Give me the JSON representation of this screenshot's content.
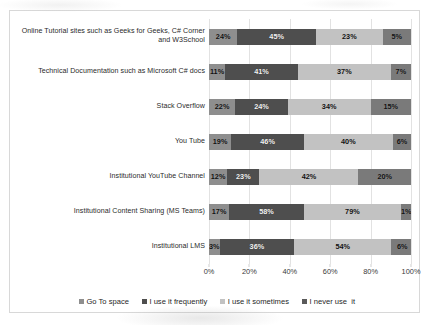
{
  "chart_data": {
    "type": "bar",
    "orientation": "horizontal",
    "stacked": true,
    "title": "",
    "xlabel": "",
    "ylabel": "",
    "xlim": [
      0,
      100
    ],
    "xticks": [
      "0%",
      "20%",
      "40%",
      "60%",
      "80%",
      "100%"
    ],
    "xtick_values": [
      0,
      20,
      40,
      60,
      80,
      100
    ],
    "grid": true,
    "legend_position": "bottom",
    "categories": [
      "Online Tutorial sites such as Geeks for Geeks, C# Corner and W3School",
      "Technical Documentation such as Microsoft C# docs",
      "Stack Overflow",
      "You Tube",
      "Institutional YouTube Channel",
      "Institutional Content Sharing (MS Teams)",
      "Institutional LMS"
    ],
    "series": [
      {
        "name": "Go To space",
        "color": "#8e8e8e",
        "labels": [
          "24%",
          "11%",
          "22%",
          "19%",
          "12%",
          "17%",
          "3%"
        ],
        "values": [
          24,
          11,
          22,
          19,
          12,
          17,
          3
        ],
        "widths": [
          14,
          8,
          13,
          11,
          9,
          10,
          4
        ]
      },
      {
        "name": "I use it frequently",
        "color": "#4e4e4e",
        "labels": [
          "45%",
          "41%",
          "24%",
          "46%",
          "23%",
          "58%",
          "36%"
        ],
        "values": [
          45,
          41,
          24,
          46,
          23,
          58,
          36
        ],
        "widths": [
          39,
          36,
          26,
          36,
          16,
          37,
          37
        ]
      },
      {
        "name": "I use it sometimes",
        "color": "#c2c2c2",
        "labels": [
          "23%",
          "37%",
          "34%",
          "40%",
          "42%",
          "79%",
          "54%"
        ],
        "values": [
          23,
          37,
          34,
          40,
          42,
          79,
          54
        ],
        "widths": [
          33,
          46,
          41,
          44,
          49,
          48,
          48
        ]
      },
      {
        "name": "I never use  it",
        "color": "#7a7a7a",
        "labels": [
          "5%",
          "7%",
          "15%",
          "6%",
          "20%",
          "1%",
          "6%"
        ],
        "values": [
          5,
          7,
          15,
          6,
          20,
          1,
          6
        ],
        "widths": [
          14,
          10,
          20,
          9,
          26,
          5,
          11
        ]
      }
    ]
  }
}
